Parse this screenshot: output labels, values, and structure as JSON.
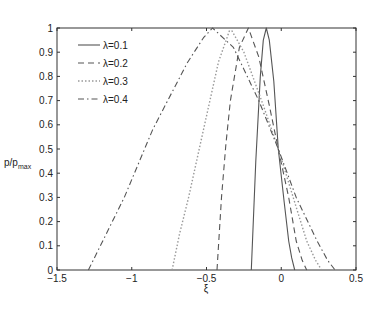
{
  "chart_data": {
    "type": "line",
    "title": "",
    "xlabel": "ξ",
    "ylabel": "p/p_max",
    "ylabel_main": "p/p",
    "ylabel_sub": "max",
    "xlim": [
      -1.5,
      0.5
    ],
    "ylim": [
      0,
      1
    ],
    "grid": false,
    "legend_position": "upper-left",
    "xticks": [
      -1.5,
      -1,
      -0.5,
      0,
      0.5
    ],
    "xtick_labels": [
      "−1.5",
      "−1",
      "−0.5",
      "0",
      "0.5"
    ],
    "yticks": [
      0,
      0.1,
      0.2,
      0.3,
      0.4,
      0.5,
      0.6,
      0.7,
      0.8,
      0.9,
      1
    ],
    "ytick_labels": [
      "0",
      "0.1",
      "0.2",
      "0.3",
      "0.4",
      "0.5",
      "0.6",
      "0.7",
      "0.8",
      "0.9",
      "1"
    ],
    "series": [
      {
        "name": "λ=0.1",
        "style": "solid",
        "color": "#555555",
        "x": [
          -0.2,
          -0.17,
          -0.14,
          -0.12,
          -0.1,
          -0.08,
          -0.05,
          -0.02,
          0.02,
          0.05,
          0.07,
          0.09
        ],
        "y": [
          0,
          0.45,
          0.8,
          0.95,
          1.0,
          0.95,
          0.78,
          0.5,
          0.28,
          0.12,
          0.05,
          0
        ]
      },
      {
        "name": "λ=0.2",
        "style": "dashed",
        "color": "#555555",
        "x": [
          -0.43,
          -0.4,
          -0.37,
          -0.34,
          -0.28,
          -0.22,
          -0.15,
          -0.08,
          -0.02,
          0.05,
          0.1,
          0.14,
          0.17
        ],
        "y": [
          0,
          0.3,
          0.52,
          0.7,
          0.92,
          1.0,
          0.88,
          0.68,
          0.5,
          0.3,
          0.12,
          0.04,
          0
        ]
      },
      {
        "name": "λ=0.3",
        "style": "dotted",
        "color": "#999999",
        "x": [
          -0.73,
          -0.68,
          -0.62,
          -0.52,
          -0.42,
          -0.34,
          -0.25,
          -0.12,
          -0.02,
          0.08,
          0.17,
          0.23,
          0.27
        ],
        "y": [
          0,
          0.15,
          0.3,
          0.58,
          0.86,
          1.0,
          0.9,
          0.68,
          0.5,
          0.3,
          0.12,
          0.04,
          0
        ]
      },
      {
        "name": "λ=0.4",
        "style": "dashdot",
        "color": "#555555",
        "x": [
          -1.29,
          -1.05,
          -0.86,
          -0.63,
          -0.52,
          -0.46,
          -0.32,
          -0.15,
          -0.02,
          0.1,
          0.24,
          0.31,
          0.36
        ],
        "y": [
          0,
          0.3,
          0.58,
          0.855,
          0.96,
          1.0,
          0.92,
          0.7,
          0.5,
          0.3,
          0.12,
          0.04,
          0
        ]
      }
    ]
  }
}
